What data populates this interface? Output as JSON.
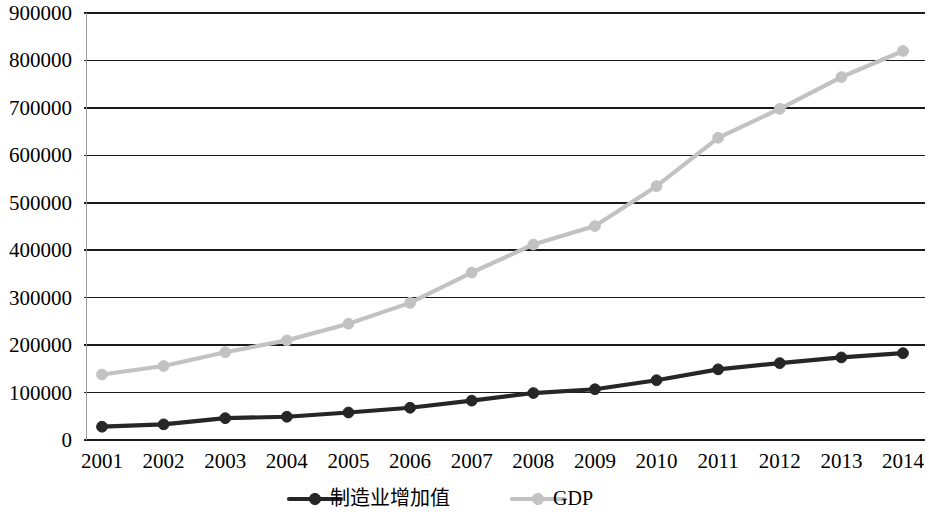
{
  "chart_data": {
    "type": "line",
    "title": "",
    "subtitle": "",
    "xlabel": "",
    "ylabel": "",
    "categories": [
      "2001",
      "2002",
      "2003",
      "2004",
      "2005",
      "2006",
      "2007",
      "2008",
      "2009",
      "2010",
      "2011",
      "2012",
      "2013",
      "2014"
    ],
    "ylim": [
      0,
      900000
    ],
    "ytick_labels": [
      "900000",
      "800000",
      "700000",
      "600000",
      "500000",
      "400000",
      "300000",
      "200000",
      "100000",
      "0"
    ],
    "ytick_values": [
      900000,
      800000,
      700000,
      600000,
      500000,
      400000,
      300000,
      200000,
      100000,
      0
    ],
    "grid": true,
    "legend_position": "bottom",
    "series": [
      {
        "name": "制造业增加值",
        "color": "#262626",
        "marker": "circle",
        "values": [
          28000,
          33000,
          46000,
          49000,
          58000,
          68000,
          83000,
          99000,
          107000,
          126000,
          149000,
          162000,
          174000,
          183000
        ]
      },
      {
        "name": "GDP",
        "color": "#c2c2c2",
        "marker": "circle",
        "values": [
          138000,
          156000,
          185000,
          210000,
          245000,
          289000,
          353000,
          412000,
          451000,
          535000,
          637000,
          698000,
          765000,
          820000
        ]
      }
    ]
  },
  "legend": {
    "items": [
      {
        "label": "制造业增加值",
        "color": "#262626"
      },
      {
        "label": "GDP",
        "color": "#c2c2c2"
      }
    ]
  }
}
